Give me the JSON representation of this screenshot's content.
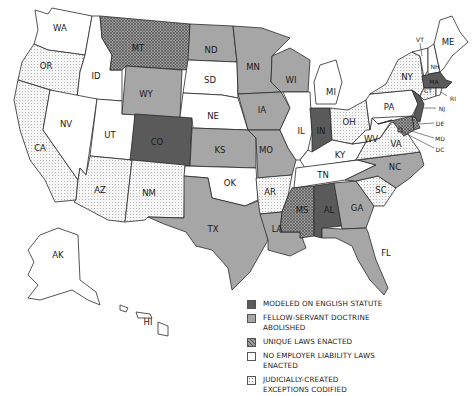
{
  "colors": {
    "english_statute": "#5a5a5a",
    "fellow_servant_abolished": "#a6a6a6",
    "unique_laws": "#8c8c8c",
    "no_laws": "#ffffff",
    "judicial_exceptions": "#f4f4f4",
    "stroke": "#2a2a2a"
  },
  "legend": {
    "items": [
      {
        "key": "english_statute",
        "label": "MODELED ON ENGLISH STATUTE"
      },
      {
        "key": "fellow_servant_abolished",
        "label": "FELLOW-SERVANT DOCTRINE ABOLISHED"
      },
      {
        "key": "unique_laws",
        "label": "UNIQUE LAWS ENACTED"
      },
      {
        "key": "no_laws",
        "label": "NO EMPLOYER LIABILITY LAWS ENACTED"
      },
      {
        "key": "judicial_exceptions",
        "label": "JUDICIALLY-CREATED EXCEPTIONS CODIFIED"
      }
    ]
  },
  "states": {
    "WA": {
      "label": "WA",
      "category": "no_laws"
    },
    "OR": {
      "label": "OR",
      "category": "judicial_exceptions"
    },
    "CA": {
      "label": "CA",
      "category": "judicial_exceptions"
    },
    "ID": {
      "label": "ID",
      "category": "no_laws"
    },
    "NV": {
      "label": "NV",
      "category": "no_laws"
    },
    "UT": {
      "label": "UT",
      "category": "no_laws"
    },
    "AZ": {
      "label": "AZ",
      "category": "judicial_exceptions"
    },
    "MT": {
      "label": "MT",
      "category": "unique_laws"
    },
    "WY": {
      "label": "WY",
      "category": "fellow_servant_abolished"
    },
    "CO": {
      "label": "CO",
      "category": "english_statute"
    },
    "NM": {
      "label": "NM",
      "category": "judicial_exceptions"
    },
    "ND": {
      "label": "ND",
      "category": "fellow_servant_abolished"
    },
    "SD": {
      "label": "SD",
      "category": "no_laws"
    },
    "NE": {
      "label": "NE",
      "category": "no_laws"
    },
    "KS": {
      "label": "KS",
      "category": "fellow_servant_abolished"
    },
    "OK": {
      "label": "OK",
      "category": "no_laws"
    },
    "TX": {
      "label": "TX",
      "category": "fellow_servant_abolished"
    },
    "MN": {
      "label": "MN",
      "category": "fellow_servant_abolished"
    },
    "IA": {
      "label": "IA",
      "category": "fellow_servant_abolished"
    },
    "MO": {
      "label": "MO",
      "category": "fellow_servant_abolished"
    },
    "AR": {
      "label": "AR",
      "category": "judicial_exceptions"
    },
    "LA": {
      "label": "LA",
      "category": "fellow_servant_abolished"
    },
    "WI": {
      "label": "WI",
      "category": "fellow_servant_abolished"
    },
    "IL": {
      "label": "IL",
      "category": "no_laws"
    },
    "MI": {
      "label": "MI",
      "category": "no_laws"
    },
    "IN": {
      "label": "IN",
      "category": "english_statute"
    },
    "OH": {
      "label": "OH",
      "category": "judicial_exceptions"
    },
    "KY": {
      "label": "KY",
      "category": "no_laws"
    },
    "TN": {
      "label": "TN",
      "category": "no_laws"
    },
    "MS": {
      "label": "MS",
      "category": "unique_laws"
    },
    "AL": {
      "label": "AL",
      "category": "english_statute"
    },
    "GA": {
      "label": "GA",
      "category": "fellow_servant_abolished"
    },
    "FL": {
      "label": "FL",
      "category": "fellow_servant_abolished"
    },
    "SC": {
      "label": "SC",
      "category": "judicial_exceptions"
    },
    "NC": {
      "label": "NC",
      "category": "fellow_servant_abolished"
    },
    "VA": {
      "label": "VA",
      "category": "judicial_exceptions"
    },
    "WV": {
      "label": "WV",
      "category": "no_laws"
    },
    "PA": {
      "label": "PA",
      "category": "no_laws"
    },
    "NY": {
      "label": "NY",
      "category": "judicial_exceptions"
    },
    "VT": {
      "label": "VT",
      "category": "no_laws"
    },
    "NH": {
      "label": "NH",
      "category": "no_laws"
    },
    "ME": {
      "label": "ME",
      "category": "no_laws"
    },
    "MA": {
      "label": "MA",
      "category": "english_statute"
    },
    "CT": {
      "label": "CT",
      "category": "judicial_exceptions"
    },
    "RI": {
      "label": "RI",
      "category": "no_laws"
    },
    "NJ": {
      "label": "NJ",
      "category": "english_statute"
    },
    "DE": {
      "label": "DE",
      "category": "unique_laws"
    },
    "MD": {
      "label": "MD",
      "category": "unique_laws"
    },
    "DC": {
      "label": "DC",
      "category": "unique_laws"
    },
    "AK": {
      "label": "AK",
      "category": "no_laws"
    },
    "HI": {
      "label": "HI",
      "category": "no_laws"
    }
  }
}
